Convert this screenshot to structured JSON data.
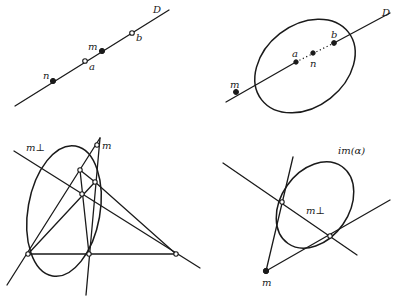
{
  "panels": {
    "top_left": {
      "line_label": "D",
      "points": {
        "n": "n",
        "a": "a",
        "m": "m",
        "b": "b"
      }
    },
    "top_right": {
      "line_label": "D",
      "points": {
        "m": "m",
        "a": "a",
        "n": "n",
        "b": "b"
      }
    },
    "bottom_left": {
      "line_label": "m⊥",
      "points": {
        "m": "m"
      }
    },
    "bottom_right": {
      "curve_label": "im(α)",
      "line_label": "m⊥",
      "points": {
        "m": "m"
      }
    }
  },
  "colors": {
    "ink": "#1a1a1a",
    "background": "#ffffff"
  }
}
